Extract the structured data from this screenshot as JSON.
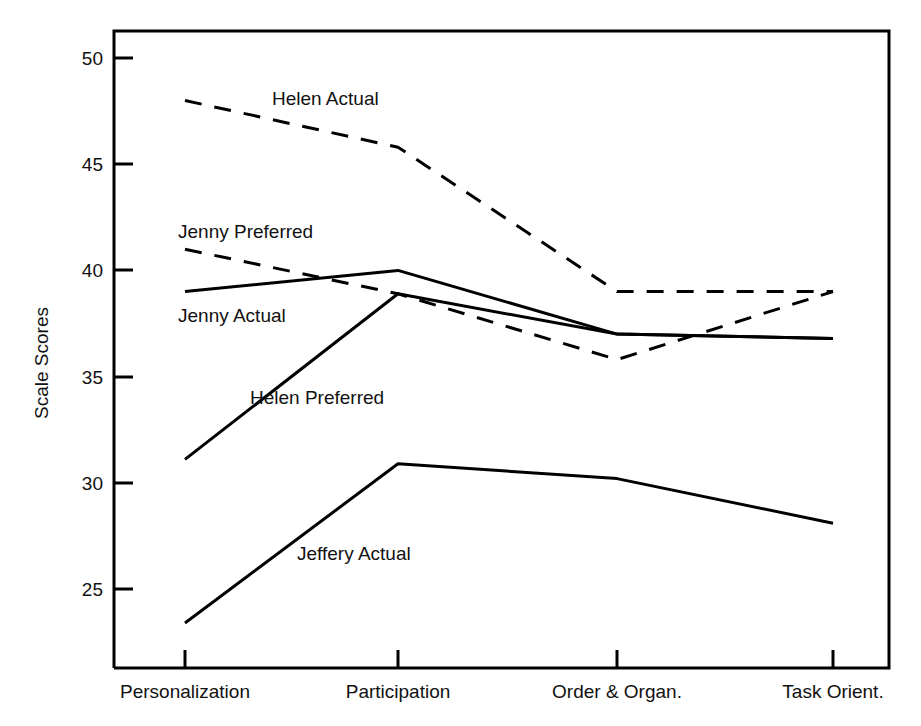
{
  "chart_data": {
    "type": "line",
    "title": "",
    "xlabel": "",
    "ylabel": "Scale Scores",
    "categories": [
      "Personalization",
      "Participation",
      "Order & Organ.",
      "Task Orient."
    ],
    "ylim": [
      21.5,
      51.5
    ],
    "yticks": [
      25,
      30,
      35,
      40,
      45,
      50
    ],
    "grid": false,
    "legend_position": "inline-annotations",
    "series": [
      {
        "name": "Helen Actual",
        "style": "dashed",
        "color": "#000000",
        "values": [
          48.0,
          45.8,
          39.0,
          39.0
        ]
      },
      {
        "name": "Jenny Preferred",
        "style": "dashed",
        "color": "#000000",
        "values": [
          41.0,
          38.9,
          35.8,
          39.0
        ]
      },
      {
        "name": "Jenny Actual",
        "style": "solid",
        "color": "#000000",
        "values": [
          39.0,
          40.0,
          37.0,
          36.8
        ]
      },
      {
        "name": "Helen Preferred",
        "style": "solid",
        "color": "#000000",
        "values": [
          31.1,
          38.9,
          37.0,
          36.8
        ]
      },
      {
        "name": "Jeffery Actual",
        "style": "solid",
        "color": "#000000",
        "values": [
          23.4,
          30.9,
          30.2,
          28.1
        ]
      }
    ],
    "annotations": [
      {
        "text": "Helen Actual",
        "x_px": 272,
        "y_px": 105
      },
      {
        "text": "Jenny Preferred",
        "x_px": 178,
        "y_px": 238
      },
      {
        "text": "Jenny Actual",
        "x_px": 178,
        "y_px": 322
      },
      {
        "text": "Helen Preferred",
        "x_px": 250,
        "y_px": 404
      },
      {
        "text": "Jeffery Actual",
        "x_px": 297,
        "y_px": 560
      }
    ]
  },
  "axis": {
    "y_title": "Scale Scores",
    "y_tick_labels": [
      "50",
      "45",
      "40",
      "35",
      "30",
      "25"
    ],
    "x_tick_labels": [
      "Personalization",
      "Participation",
      "Order & Organ.",
      "Task Orient."
    ]
  },
  "colors": {
    "line": "#000000",
    "frame": "#000000",
    "background": "#ffffff"
  }
}
